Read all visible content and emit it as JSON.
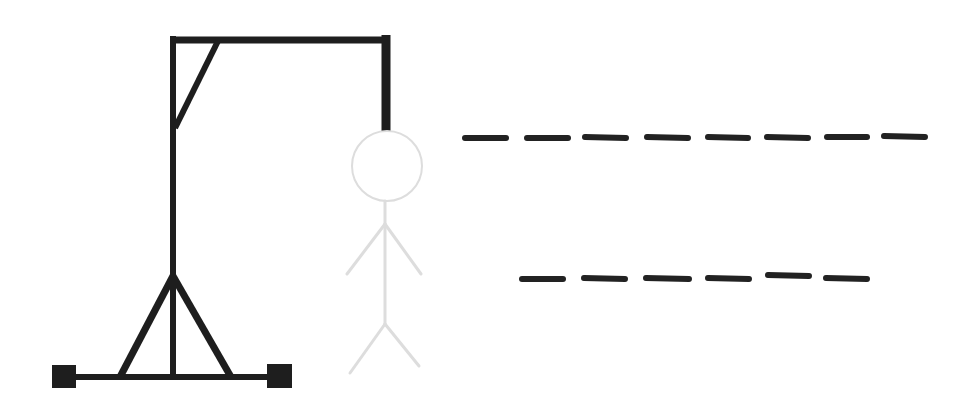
{
  "game": {
    "title": "Hangman",
    "colors": {
      "gallows": "#1e1e1e",
      "figure_hidden": "#dddddd",
      "blank": "#222222",
      "background": "#ffffff"
    },
    "figure_state": "not-yet-revealed (all parts light gray)",
    "word_rows": [
      {
        "letters": [
          "",
          "",
          "",
          "",
          "",
          "",
          "",
          ""
        ],
        "blank_count": 8
      },
      {
        "letters": [
          "",
          "",
          "",
          "",
          "",
          ""
        ],
        "blank_count": 6
      }
    ]
  }
}
